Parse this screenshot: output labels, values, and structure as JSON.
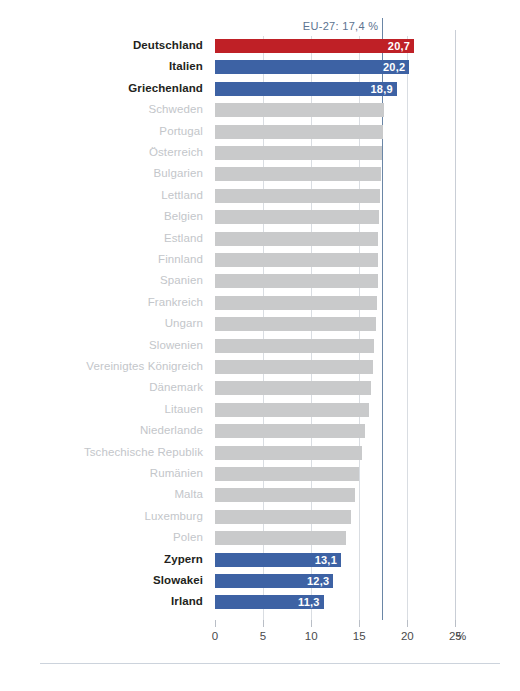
{
  "chart_data": {
    "type": "bar",
    "orientation": "horizontal",
    "title": "",
    "xlabel": "%",
    "ylabel": "",
    "xlim": [
      0,
      26
    ],
    "grid": true,
    "axis_unit": "%",
    "tick_values": [
      0,
      5,
      10,
      15,
      20,
      25
    ],
    "tick_labels": [
      "0",
      "5",
      "10",
      "15",
      "20",
      "25"
    ],
    "reference_line": {
      "label": "EU-27: 17,4 %",
      "value": 17.4,
      "color": "#6a86a6"
    },
    "colors": {
      "highlight_top": "#bf2026",
      "highlight_blue": "#3d62a4",
      "neutral": "#c9cacb",
      "label_muted": "#c3c6ca",
      "label_strong": "#231f20"
    },
    "categories": [
      "Deutschland",
      "Italien",
      "Griechenland",
      "Schweden",
      "Portugal",
      "Österreich",
      "Bulgarien",
      "Lettland",
      "Belgien",
      "Estland",
      "Finnland",
      "Spanien",
      "Frankreich",
      "Ungarn",
      "Slowenien",
      "Vereinigtes Königreich",
      "Dänemark",
      "Litauen",
      "Niederlande",
      "Tschechische Republik",
      "Rumänien",
      "Malta",
      "Luxemburg",
      "Polen",
      "Zypern",
      "Slowakei",
      "Irland"
    ],
    "values": [
      20.7,
      20.2,
      18.9,
      17.6,
      17.5,
      17.4,
      17.3,
      17.2,
      17.1,
      17.0,
      17.0,
      16.9,
      16.8,
      16.7,
      16.5,
      16.4,
      16.2,
      16.0,
      15.6,
      15.3,
      15.0,
      14.6,
      14.1,
      13.6,
      13.1,
      12.3,
      11.3
    ],
    "bars": [
      {
        "label": "Deutschland",
        "value": 20.7,
        "display": "20,7",
        "style": "red",
        "emphasis": true
      },
      {
        "label": "Italien",
        "value": 20.2,
        "display": "20,2",
        "style": "blue",
        "emphasis": true
      },
      {
        "label": "Griechenland",
        "value": 18.9,
        "display": "18,9",
        "style": "blue",
        "emphasis": true
      },
      {
        "label": "Schweden",
        "value": 17.6,
        "display": "",
        "style": "neutral",
        "emphasis": false
      },
      {
        "label": "Portugal",
        "value": 17.5,
        "display": "",
        "style": "neutral",
        "emphasis": false
      },
      {
        "label": "Österreich",
        "value": 17.4,
        "display": "",
        "style": "neutral",
        "emphasis": false
      },
      {
        "label": "Bulgarien",
        "value": 17.3,
        "display": "",
        "style": "neutral",
        "emphasis": false
      },
      {
        "label": "Lettland",
        "value": 17.2,
        "display": "",
        "style": "neutral",
        "emphasis": false
      },
      {
        "label": "Belgien",
        "value": 17.1,
        "display": "",
        "style": "neutral",
        "emphasis": false
      },
      {
        "label": "Estland",
        "value": 17.0,
        "display": "",
        "style": "neutral",
        "emphasis": false
      },
      {
        "label": "Finnland",
        "value": 17.0,
        "display": "",
        "style": "neutral",
        "emphasis": false
      },
      {
        "label": "Spanien",
        "value": 16.9,
        "display": "",
        "style": "neutral",
        "emphasis": false
      },
      {
        "label": "Frankreich",
        "value": 16.8,
        "display": "",
        "style": "neutral",
        "emphasis": false
      },
      {
        "label": "Ungarn",
        "value": 16.7,
        "display": "",
        "style": "neutral",
        "emphasis": false
      },
      {
        "label": "Slowenien",
        "value": 16.5,
        "display": "",
        "style": "neutral",
        "emphasis": false
      },
      {
        "label": "Vereinigtes Königreich",
        "value": 16.4,
        "display": "",
        "style": "neutral",
        "emphasis": false
      },
      {
        "label": "Dänemark",
        "value": 16.2,
        "display": "",
        "style": "neutral",
        "emphasis": false
      },
      {
        "label": "Litauen",
        "value": 16.0,
        "display": "",
        "style": "neutral",
        "emphasis": false
      },
      {
        "label": "Niederlande",
        "value": 15.6,
        "display": "",
        "style": "neutral",
        "emphasis": false
      },
      {
        "label": "Tschechische Republik",
        "value": 15.3,
        "display": "",
        "style": "neutral",
        "emphasis": false
      },
      {
        "label": "Rumänien",
        "value": 15.0,
        "display": "",
        "style": "neutral",
        "emphasis": false
      },
      {
        "label": "Malta",
        "value": 14.6,
        "display": "",
        "style": "neutral",
        "emphasis": false
      },
      {
        "label": "Luxemburg",
        "value": 14.1,
        "display": "",
        "style": "neutral",
        "emphasis": false
      },
      {
        "label": "Polen",
        "value": 13.6,
        "display": "",
        "style": "neutral",
        "emphasis": false
      },
      {
        "label": "Zypern",
        "value": 13.1,
        "display": "13,1",
        "style": "blue",
        "emphasis": true
      },
      {
        "label": "Slowakei",
        "value": 12.3,
        "display": "12,3",
        "style": "blue",
        "emphasis": true
      },
      {
        "label": "Irland",
        "value": 11.3,
        "display": "11,3",
        "style": "blue",
        "emphasis": true
      }
    ]
  }
}
